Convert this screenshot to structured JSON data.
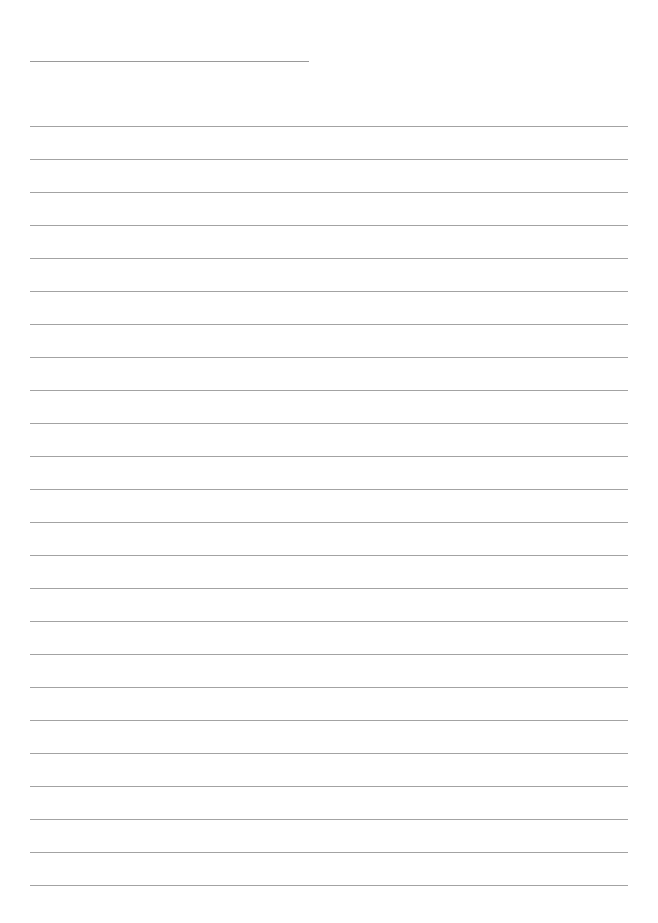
{
  "page": {
    "type": "blank lined paper",
    "background": "#ffffff",
    "line_color": "#a3a3a3",
    "title_line": {
      "present": true
    },
    "ruled_lines": {
      "count": 24,
      "first_top": 126,
      "spacing": 33
    },
    "text": ""
  }
}
